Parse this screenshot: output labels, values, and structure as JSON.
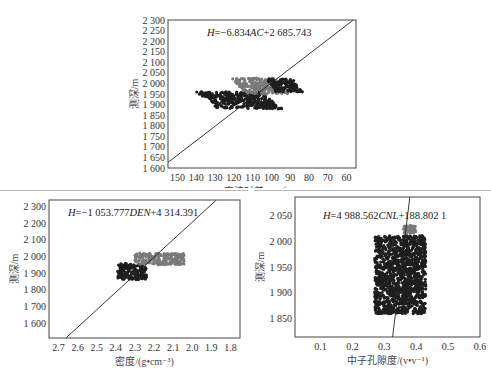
{
  "chart_data": [
    {
      "id": "ac",
      "type": "scatter",
      "title": "",
      "equation": "H=−6.834AC+2 685.743",
      "equation_parts": {
        "lhs": "H",
        "op": "=−6.834",
        "var": "AC",
        "rest": "+2 685.743"
      },
      "xlabel": "声波时差/(μs•ft⁻¹)",
      "ylabel": "测深/m",
      "xlim": [
        155,
        55
      ],
      "ylim": [
        1600,
        2300
      ],
      "x_ticks": [
        150,
        140,
        130,
        120,
        110,
        100,
        90,
        80,
        70,
        60
      ],
      "x_tick_labels": [
        "150",
        "140",
        "130",
        "120",
        "110",
        "100",
        "90",
        "80",
        "70",
        "60"
      ],
      "y_ticks": [
        1600,
        1650,
        1700,
        1750,
        1800,
        1850,
        1900,
        1950,
        2000,
        2050,
        2100,
        2150,
        2200,
        2250,
        2300
      ],
      "y_tick_labels": [
        "1 600",
        "1 650",
        "1 700",
        "1 750",
        "1 800",
        "1 850",
        "1 900",
        "1 950",
        "2 000",
        "2 050",
        "2 100",
        "2 150",
        "2 200",
        "2 250",
        "2 300"
      ],
      "grid": false,
      "fit_line": {
        "slope": -6.834,
        "intercept": 2685.743
      },
      "clusters": [
        {
          "name": "dark",
          "color": "#1e1e1e",
          "x_range": [
            134,
            100
          ],
          "y_range": [
            1880,
            1960
          ]
        },
        {
          "name": "gray",
          "color": "#7a7a7a",
          "x_range": [
            117,
            94
          ],
          "y_range": [
            1950,
            2025
          ]
        },
        {
          "name": "dark-right",
          "color": "#1e1e1e",
          "x_range": [
            100,
            86
          ],
          "y_range": [
            1960,
            2020
          ]
        }
      ]
    },
    {
      "id": "den",
      "type": "scatter",
      "title": "",
      "equation": "H=−1 053.777DEN+4 314.391",
      "equation_parts": {
        "lhs": "H",
        "op": "=−1 053.777",
        "var": "DEN",
        "rest": "+4 314.391"
      },
      "xlabel": "密度/(g•cm⁻³)",
      "ylabel": "测深/m",
      "xlim": [
        2.75,
        1.75
      ],
      "ylim": [
        1510,
        2340
      ],
      "x_ticks": [
        2.7,
        2.6,
        2.5,
        2.4,
        2.3,
        2.2,
        2.1,
        2.0,
        1.9,
        1.8
      ],
      "x_tick_labels": [
        "2.7",
        "2.6",
        "2.5",
        "2.4",
        "2.3",
        "2.2",
        "2.1",
        "2.0",
        "1.9",
        "1.8"
      ],
      "y_ticks": [
        1600,
        1700,
        1800,
        1900,
        2000,
        2100,
        2200,
        2300
      ],
      "y_tick_labels": [
        "1 600",
        "1 700",
        "1 800",
        "1 900",
        "2 000",
        "2 100",
        "2 200",
        "2 300"
      ],
      "grid": false,
      "fit_line": {
        "slope": -1053.777,
        "intercept": 4314.391
      },
      "clusters": [
        {
          "name": "dark",
          "color": "#1e1e1e",
          "x_range": [
            2.39,
            2.24
          ],
          "y_range": [
            1860,
            1960
          ]
        },
        {
          "name": "gray",
          "color": "#7a7a7a",
          "x_range": [
            2.3,
            2.04
          ],
          "y_range": [
            1950,
            2020
          ]
        }
      ]
    },
    {
      "id": "cnl",
      "type": "scatter",
      "title": "",
      "equation": "H=4 988.562CNL+188.802 1",
      "equation_parts": {
        "lhs": "H",
        "op": "=4 988.562",
        "var": "CNL",
        "rest": "+188.802 1"
      },
      "xlabel": "中子孔隙度/(v•v⁻¹)",
      "ylabel": "测深/m",
      "xlim": [
        0.02,
        0.6
      ],
      "ylim": [
        1815,
        2085
      ],
      "x_ticks": [
        0.1,
        0.2,
        0.3,
        0.4,
        0.5,
        0.6
      ],
      "x_tick_labels": [
        "0.1",
        "0.2",
        "0.3",
        "0.4",
        "0.5",
        "0.6"
      ],
      "y_ticks": [
        1850,
        1900,
        1950,
        2000,
        2050
      ],
      "y_tick_labels": [
        "1 850",
        "1 900",
        "1 950",
        "2 000",
        "2 050"
      ],
      "grid": false,
      "fit_line": {
        "slope": 4988.562,
        "intercept": 188.8021
      },
      "clusters": [
        {
          "name": "dark",
          "color": "#1e1e1e",
          "x_range": [
            0.27,
            0.43
          ],
          "y_range": [
            1860,
            2010
          ]
        },
        {
          "name": "gray",
          "color": "#7a7a7a",
          "x_range": [
            0.36,
            0.4
          ],
          "y_range": [
            2015,
            2030
          ]
        }
      ]
    }
  ]
}
